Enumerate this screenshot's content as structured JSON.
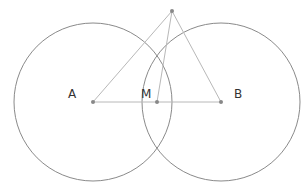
{
  "diagram": {
    "title_partial": "",
    "colors": {
      "circle": "#8a8a8a",
      "segment": "#b8b8b8",
      "point": "#888888",
      "label": "#333333"
    },
    "points": [
      {
        "id": "A",
        "label": "A",
        "x": 93,
        "y": 102,
        "label_x": 68,
        "label_y": 98
      },
      {
        "id": "M",
        "label": "M",
        "x": 157,
        "y": 102,
        "label_x": 141,
        "label_y": 98
      },
      {
        "id": "B",
        "label": "B",
        "x": 221,
        "y": 102,
        "label_x": 234,
        "label_y": 98
      },
      {
        "id": "P",
        "label": "",
        "x": 172,
        "y": 11
      }
    ],
    "circles": [
      {
        "center": "A",
        "cx": 93,
        "cy": 102,
        "r": 79
      },
      {
        "center": "B",
        "cx": 221,
        "cy": 102,
        "r": 79
      }
    ],
    "segments": [
      [
        "A",
        "B"
      ],
      [
        "P",
        "A"
      ],
      [
        "P",
        "M"
      ],
      [
        "P",
        "B"
      ]
    ]
  }
}
